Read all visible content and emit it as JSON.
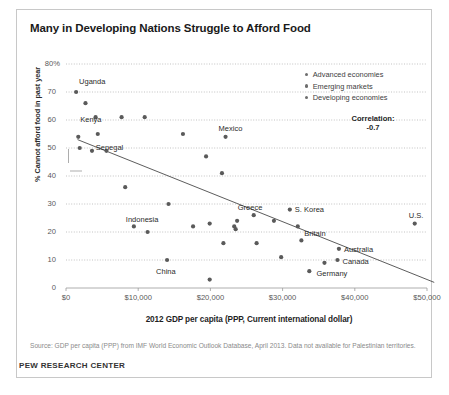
{
  "chart_data": {
    "type": "scatter",
    "title": "Many in Developing Nations Struggle to Afford Food",
    "xlabel": "2012 GDP per capita (PPP, Current international dollar)",
    "ylabel": "% Cannot afford food in past year",
    "xlim": [
      0,
      50000
    ],
    "ylim": [
      0,
      80
    ],
    "grid": true,
    "xticks": [
      0,
      10000,
      20000,
      30000,
      40000,
      50000
    ],
    "xtick_labels": [
      "$0",
      "$10,000",
      "$20,000",
      "$30,000",
      "$40,000",
      "$50,000"
    ],
    "yticks": [
      0,
      10,
      20,
      30,
      40,
      50,
      60,
      70,
      80
    ],
    "ytick_labels": [
      "0",
      "10",
      "20",
      "30",
      "40",
      "50",
      "60",
      "70",
      "80%"
    ],
    "legend_position": "top-right",
    "legend": [
      "Advanced economies",
      "Emerging markets",
      "Developing economies"
    ],
    "annotations": {
      "correlation_label": "Correlation:",
      "correlation_value": "-0.7"
    },
    "trendline": {
      "x": [
        1600,
        51000
      ],
      "y": [
        53,
        2
      ]
    },
    "points": [
      {
        "label": "Uganda",
        "x": 1400,
        "y": 70
      },
      {
        "label": "",
        "x": 2700,
        "y": 66
      },
      {
        "label": "",
        "x": 4100,
        "y": 61
      },
      {
        "label": "",
        "x": 7700,
        "y": 61
      },
      {
        "label": "",
        "x": 10900,
        "y": 61
      },
      {
        "label": "Kenya",
        "x": 1700,
        "y": 54
      },
      {
        "label": "",
        "x": 4400,
        "y": 55
      },
      {
        "label": "Senegal",
        "x": 1900,
        "y": 50
      },
      {
        "label": "",
        "x": 3600,
        "y": 49
      },
      {
        "label": "",
        "x": 5600,
        "y": 49
      },
      {
        "label": "",
        "x": 16200,
        "y": 55
      },
      {
        "label": "Mexico",
        "x": 22100,
        "y": 54
      },
      {
        "label": "",
        "x": 19400,
        "y": 47
      },
      {
        "label": "",
        "x": 21600,
        "y": 41
      },
      {
        "label": "",
        "x": 8200,
        "y": 36
      },
      {
        "label": "",
        "x": 14200,
        "y": 30
      },
      {
        "label": "Indonesia",
        "x": 9400,
        "y": 22
      },
      {
        "label": "",
        "x": 11300,
        "y": 20
      },
      {
        "label": "",
        "x": 17600,
        "y": 22
      },
      {
        "label": "",
        "x": 19900,
        "y": 23
      },
      {
        "label": "",
        "x": 23700,
        "y": 24
      },
      {
        "label": "",
        "x": 23300,
        "y": 22
      },
      {
        "label": "",
        "x": 23500,
        "y": 21
      },
      {
        "label": "",
        "x": 21800,
        "y": 16
      },
      {
        "label": "",
        "x": 26400,
        "y": 16
      },
      {
        "label": "China",
        "x": 14000,
        "y": 10
      },
      {
        "label": "",
        "x": 19900,
        "y": 3
      },
      {
        "label": "Greece",
        "x": 26000,
        "y": 26
      },
      {
        "label": "",
        "x": 28800,
        "y": 24
      },
      {
        "label": "S. Korea",
        "x": 31000,
        "y": 28
      },
      {
        "label": "",
        "x": 32100,
        "y": 22
      },
      {
        "label": "Britain",
        "x": 32600,
        "y": 17
      },
      {
        "label": "",
        "x": 29800,
        "y": 11
      },
      {
        "label": "",
        "x": 33700,
        "y": 6
      },
      {
        "label": "Australia",
        "x": 37800,
        "y": 14
      },
      {
        "label": "Canada",
        "x": 37600,
        "y": 10
      },
      {
        "label": "Germany",
        "x": 35800,
        "y": 9
      },
      {
        "label": "U.S.",
        "x": 48300,
        "y": 23
      }
    ]
  },
  "footer": {
    "source": "Source: GDP per capita (PPP) from IMF World Economic Outlook Database, April 2013. Data not available for Palestinian territories.",
    "org": "PEW RESEARCH CENTER"
  },
  "colors": {
    "point": "#5a5a5a",
    "trendline": "#4a4a4a",
    "grid": "#b4b4b4",
    "axis": "#9a9a9a",
    "frame": "#c8c8c8"
  }
}
